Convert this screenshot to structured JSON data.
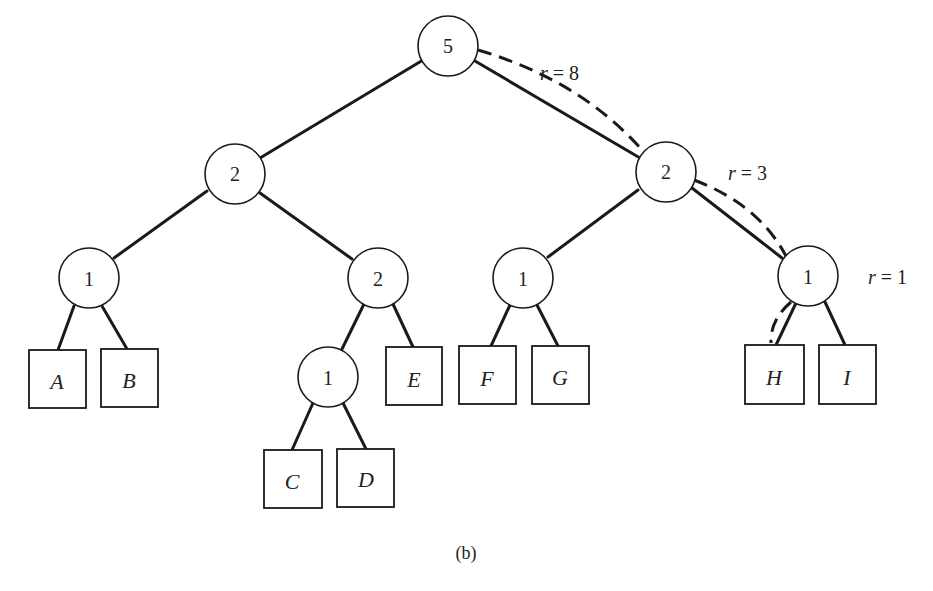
{
  "figure": {
    "caption": "(b)",
    "internal_nodes": [
      {
        "id": "root",
        "value": "5",
        "cx": 448,
        "cy": 46
      },
      {
        "id": "L",
        "value": "2",
        "cx": 235,
        "cy": 174
      },
      {
        "id": "R",
        "value": "2",
        "cx": 666,
        "cy": 172
      },
      {
        "id": "LL",
        "value": "1",
        "cx": 89,
        "cy": 278
      },
      {
        "id": "LR",
        "value": "2",
        "cx": 378,
        "cy": 278
      },
      {
        "id": "RL",
        "value": "1",
        "cx": 523,
        "cy": 278
      },
      {
        "id": "RR",
        "value": "1",
        "cx": 808,
        "cy": 278
      },
      {
        "id": "LRL",
        "value": "1",
        "cx": 328,
        "cy": 377
      }
    ],
    "leaves": [
      {
        "label": "A",
        "x": 29,
        "y": 350,
        "w": 57,
        "h": 58
      },
      {
        "label": "B",
        "x": 101,
        "y": 349,
        "w": 57,
        "h": 58
      },
      {
        "label": "C",
        "x": 264,
        "y": 450,
        "w": 58,
        "h": 58
      },
      {
        "label": "D",
        "x": 337,
        "y": 449,
        "w": 57,
        "h": 58
      },
      {
        "label": "E",
        "x": 386,
        "y": 347,
        "w": 56,
        "h": 58
      },
      {
        "label": "F",
        "x": 459,
        "y": 346,
        "w": 57,
        "h": 58
      },
      {
        "label": "G",
        "x": 532,
        "y": 346,
        "w": 57,
        "h": 58
      },
      {
        "label": "H",
        "x": 745,
        "y": 345,
        "w": 59,
        "h": 59
      },
      {
        "label": "I",
        "x": 819,
        "y": 345,
        "w": 57,
        "h": 59
      }
    ],
    "r_labels": [
      {
        "text_var": "r",
        "text_rest": " = 8",
        "x": 540,
        "y": 80
      },
      {
        "text_var": "r",
        "text_rest": " = 3",
        "x": 728,
        "y": 180
      },
      {
        "text_var": "r",
        "text_rest": " = 1",
        "x": 868,
        "y": 284
      }
    ]
  }
}
